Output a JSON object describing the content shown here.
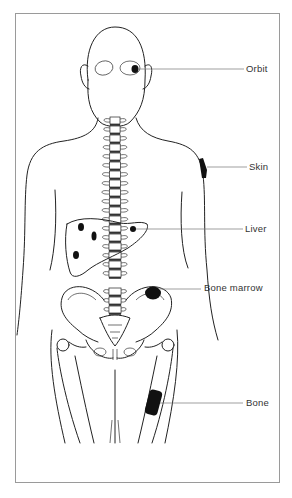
{
  "diagram": {
    "labels": [
      {
        "id": "orbit",
        "text": "Orbit",
        "x": 246,
        "y": 64,
        "line": [
          138,
          69,
          244,
          69
        ]
      },
      {
        "id": "skin",
        "text": "Skin",
        "x": 249,
        "y": 162,
        "line": [
          207,
          167,
          247,
          167
        ]
      },
      {
        "id": "liver",
        "text": "Liver",
        "x": 245,
        "y": 224,
        "line": [
          136,
          229,
          243,
          229
        ]
      },
      {
        "id": "bone_marrow",
        "text": "Bone marrow",
        "x": 204,
        "y": 283,
        "line": [
          160,
          289,
          201,
          289
        ]
      },
      {
        "id": "bone",
        "text": "Bone",
        "x": 246,
        "y": 398,
        "line": [
          160,
          403,
          243,
          403
        ]
      }
    ],
    "lesions": {
      "orbit": {
        "cx": 135,
        "cy": 69,
        "rx": 3.5,
        "ry": 4
      },
      "skin": {
        "points": "199,159 203,158 207,170 206,178 202,178"
      },
      "liver_spots": [
        {
          "cx": 81,
          "cy": 227,
          "rx": 3,
          "ry": 4
        },
        {
          "cx": 94,
          "cy": 236,
          "rx": 2.5,
          "ry": 4.5
        },
        {
          "cx": 76,
          "cy": 255,
          "rx": 3,
          "ry": 4
        },
        {
          "cx": 133,
          "cy": 229,
          "rx": 3,
          "ry": 3
        }
      ],
      "bone_marrow": {
        "cx": 153,
        "cy": 293,
        "rx": 8,
        "ry": 6.5
      },
      "bone": {
        "x": 147,
        "y": 390,
        "width": 13,
        "height": 25,
        "rotate": 15
      }
    },
    "colors": {
      "frame": "#9a9a9a",
      "line": "#222222",
      "lesion": "#111111",
      "label": "#333333"
    }
  }
}
